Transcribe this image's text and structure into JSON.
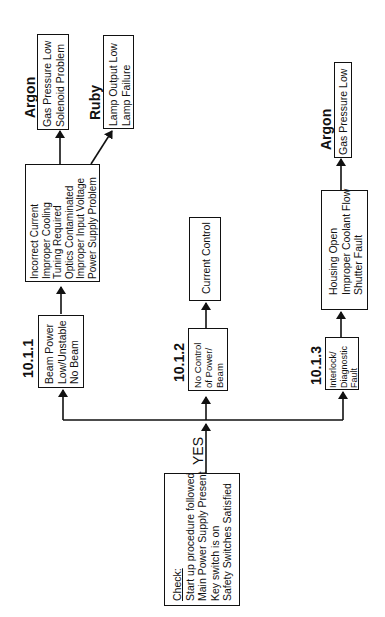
{
  "orientation": "rotated -90deg (read bottom-to-top)",
  "start_box": {
    "title": "Check:",
    "lines": [
      "Start up procedure followed",
      "Main Power Supply Present",
      "Key switch is on",
      "Safety Switches Satisfied"
    ]
  },
  "yes_label": "YES",
  "branches": [
    {
      "id": "10.1.1",
      "symptom": [
        "Beam Power",
        "Low/Unstable",
        "No Beam"
      ],
      "causes": [
        "Incorrect Current",
        "Improper Cooling",
        "Tuning Required",
        "Optics Contaminated",
        "Improper Input Voltage",
        "Power Supply Problem"
      ],
      "subs": [
        {
          "label": "Argon",
          "items": [
            "Gas Pressure Low",
            "Solenoid  Problem"
          ]
        },
        {
          "label": "Ruby",
          "items": [
            "Lamp Output Low",
            "Lamp Failure"
          ]
        }
      ]
    },
    {
      "id": "10.1.2",
      "symptom": [
        "No Control",
        "of Power/",
        "Beam"
      ],
      "causes": [
        "Current Control"
      ]
    },
    {
      "id": "10.1.3",
      "symptom": [
        "Interlock/",
        "Diagnostic",
        "Fault"
      ],
      "causes": [
        "Housing Open",
        "Improper Coolant Flow",
        "Shutter Fault"
      ],
      "subs": [
        {
          "label": "Argon",
          "items": [
            "Gas Pressure Low"
          ]
        }
      ]
    }
  ]
}
